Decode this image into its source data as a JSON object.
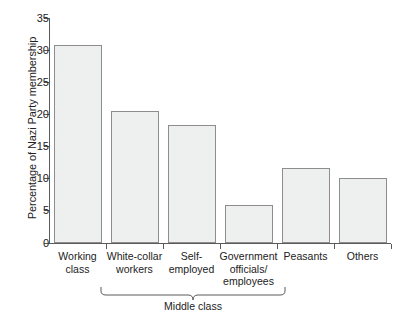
{
  "chart_data": {
    "type": "bar",
    "title": "",
    "xlabel": "",
    "ylabel": "Percentage of Nazi Party membership",
    "ylim": [
      0,
      35
    ],
    "ytick_step": 5,
    "yticks": [
      0,
      5,
      10,
      15,
      20,
      25,
      30,
      35
    ],
    "ytick_labels": [
      "0",
      "5",
      "10",
      "15",
      "20",
      "25",
      "30",
      "35"
    ],
    "grid": false,
    "legend": "none",
    "categories": [
      "Working class",
      "White-collar workers",
      "Self-employed",
      "Government officials/ employees",
      "Peasants",
      "Others"
    ],
    "category_lines": [
      [
        "Working",
        "class"
      ],
      [
        "White-collar",
        "workers"
      ],
      [
        "Self-",
        "employed"
      ],
      [
        "Government",
        "officials/",
        "employees"
      ],
      [
        "Peasants"
      ],
      [
        "Others"
      ]
    ],
    "values": [
      30.8,
      20.5,
      18.3,
      5.9,
      11.7,
      10.1
    ],
    "annotations": [
      {
        "text": "Middle class",
        "type": "group-bracket",
        "spans_categories": [
          "White-collar workers",
          "Self-employed",
          "Government officials/ employees"
        ]
      }
    ],
    "colors": {
      "bar_fill": "#eef0f0",
      "bar_border": "#8d8d8d",
      "axis": "#5a5a5a",
      "text": "#222222",
      "background": "#ffffff"
    }
  }
}
